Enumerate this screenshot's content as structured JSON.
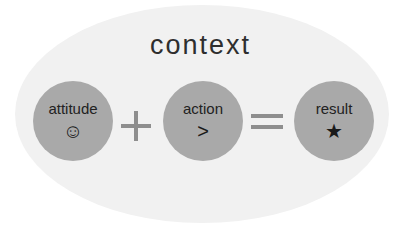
{
  "diagram": {
    "title": "context",
    "nodes": [
      {
        "label": "attitude",
        "symbol": "☺",
        "symbol_name": "smiley-face"
      },
      {
        "label": "action",
        "symbol": ">",
        "symbol_name": "greater-than"
      },
      {
        "label": "result",
        "symbol": "★",
        "symbol_name": "star"
      }
    ],
    "operators": [
      "+",
      "="
    ],
    "colors": {
      "background_ellipse": "#f1f1f1",
      "node_fill": "#a9a9a9",
      "operator": "#8e8e8e",
      "text": "#2e2e2e"
    }
  }
}
